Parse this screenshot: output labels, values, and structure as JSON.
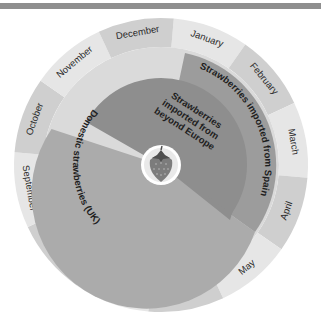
{
  "diagram": {
    "months": [
      "January",
      "February",
      "March",
      "April",
      "May",
      "June",
      "July",
      "August",
      "September",
      "October",
      "November",
      "December"
    ],
    "segments": [
      {
        "name": "Domestic strawberries (UK)",
        "label": "Domestic strawberries (UK)",
        "color": "#a9a9a9"
      },
      {
        "name": "Strawberries imported from Spain",
        "label": "Strawberries imported from Spain",
        "color": "#9a9a9a"
      },
      {
        "name": "Strawberries imported from beyond Europe",
        "label_lines": [
          "Strawberries",
          "imported from",
          "beyond Europe"
        ],
        "color": "#8c8c8c"
      }
    ],
    "center_icon": "strawberry-icon",
    "colors": {
      "month_light": "#e6e6e6",
      "month_dark": "#cfcfcf",
      "inner_disk": "#d9d9d9",
      "top_bar": "#8f8f8f"
    }
  }
}
